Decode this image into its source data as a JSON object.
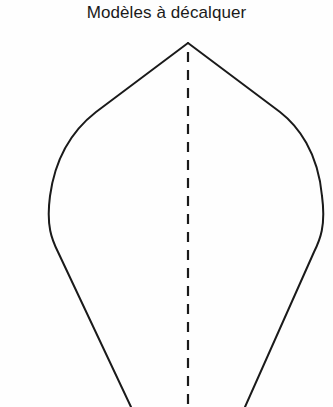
{
  "page": {
    "background_color": "#fefefe",
    "ink_color": "#1a1a1a",
    "width": 333,
    "height": 407
  },
  "title": {
    "text": "Modèles à décalquer"
  },
  "figure": {
    "name": "leaf-template-outline",
    "apex": {
      "x": 188,
      "y": 43
    },
    "stroke_color": "#1a1a1a",
    "stroke_width": 2,
    "left_outline_path": "M 188 43 L 96 112 C 78 126 56 152 50 196 C 46 226 52 240 58 252 L 131 407",
    "right_outline_path": "M 188 43 L 280 112 C 298 126 318 152 322 196 C 326 226 320 240 314 252 L 245 407",
    "fold_line": {
      "name": "center-fold-dashed-line",
      "path": "M 188 52 L 188 407",
      "dash_length": 10,
      "gap_length": 8,
      "stroke_width": 2.2
    }
  }
}
